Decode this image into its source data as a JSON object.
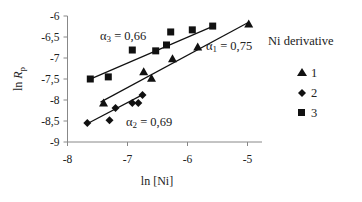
{
  "chart_data": {
    "type": "scatter",
    "title": "",
    "xlabel": "ln [Ni]",
    "ylabel": "ln R_p",
    "ylabel_main": "ln ",
    "ylabel_italic": "R",
    "ylabel_sub": "p",
    "xlim": [
      -8,
      -5
    ],
    "ylim": [
      -9,
      -6
    ],
    "xticks": [
      -8,
      -7,
      -6,
      -5
    ],
    "xtick_labels": [
      "-8",
      "-7",
      "-6",
      "-5"
    ],
    "yticks": [
      -6,
      -6.5,
      -7,
      -7.5,
      -8,
      -8.5,
      -9
    ],
    "ytick_labels": [
      "-6",
      "-6,5",
      "-7",
      "-7,5",
      "-8",
      "-8,5",
      "-9"
    ],
    "grid": false,
    "legend_position": "right",
    "legend_title": "Ni derivative",
    "series": [
      {
        "name": "1",
        "marker": "triangle",
        "points": [
          [
            -7.4,
            -8.07
          ],
          [
            -6.73,
            -7.33
          ],
          [
            -6.6,
            -7.48
          ],
          [
            -6.25,
            -7.02
          ],
          [
            -5.83,
            -6.74
          ],
          [
            -4.98,
            -6.19
          ]
        ],
        "fit_line": [
          [
            -7.45,
            -8.05
          ],
          [
            -4.98,
            -6.15
          ]
        ],
        "annotation": "α1 = 0,75",
        "annotation_main": "α",
        "annotation_sub": "1",
        "annotation_rest": " = 0,75",
        "slope": 0.75
      },
      {
        "name": "2",
        "marker": "diamond",
        "points": [
          [
            -7.67,
            -8.55
          ],
          [
            -7.3,
            -8.48
          ],
          [
            -7.2,
            -8.19
          ],
          [
            -6.92,
            -8.07
          ],
          [
            -6.82,
            -8.07
          ],
          [
            -6.75,
            -7.88
          ]
        ],
        "fit_line": [
          [
            -7.68,
            -8.57
          ],
          [
            -6.73,
            -7.86
          ]
        ],
        "annotation": "α2 = 0,69",
        "annotation_main": "α",
        "annotation_sub": "2",
        "annotation_rest": " = 0,69",
        "slope": 0.69
      },
      {
        "name": "3",
        "marker": "square",
        "points": [
          [
            -7.62,
            -7.5
          ],
          [
            -7.32,
            -7.45
          ],
          [
            -6.92,
            -6.81
          ],
          [
            -6.53,
            -6.83
          ],
          [
            -6.35,
            -6.69
          ],
          [
            -6.28,
            -6.38
          ],
          [
            -5.92,
            -6.33
          ],
          [
            -5.58,
            -6.24
          ]
        ],
        "fit_line": [
          [
            -7.65,
            -7.52
          ],
          [
            -5.57,
            -6.24
          ]
        ],
        "annotation": "α3 = 0,66",
        "annotation_main": "α",
        "annotation_sub": "3",
        "annotation_rest": " = 0,66",
        "slope": 0.66
      }
    ]
  }
}
